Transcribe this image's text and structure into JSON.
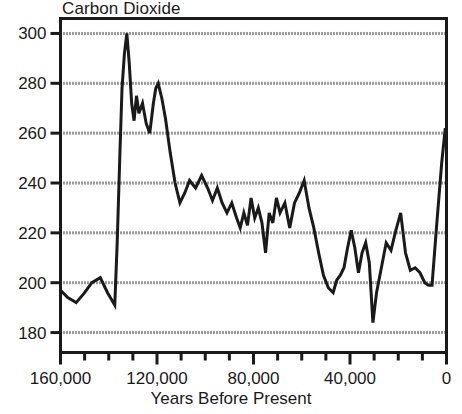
{
  "chart_data": {
    "type": "line",
    "title": "Carbon Dioxide",
    "xlabel": "Years Before Present",
    "ylabel": "",
    "xlim": [
      160000,
      0
    ],
    "ylim": [
      172,
      306
    ],
    "x_reversed": true,
    "grid": true,
    "grid_axis": "y",
    "legend": "none",
    "xtick_labels": [
      "160,000",
      "120,000",
      "80,000",
      "40,000",
      "0"
    ],
    "xtick_values": [
      160000,
      120000,
      80000,
      40000,
      0
    ],
    "x_minor_tick_interval": 10000,
    "ytick_labels": [
      "300",
      "280",
      "260",
      "240",
      "220",
      "200",
      "180"
    ],
    "ytick_values": [
      300,
      280,
      260,
      240,
      220,
      200,
      180
    ],
    "series_name": "CO2 concentration (ppm)",
    "line_color": "#1a1a1a",
    "grid_color": "#b4b4b4",
    "axis_color": "#1a1a1a",
    "x": [
      160000,
      157000,
      153500,
      150000,
      147000,
      143500,
      140500,
      137500,
      136500,
      135500,
      134500,
      133500,
      132500,
      131500,
      130500,
      129500,
      128500,
      127500,
      126000,
      124500,
      123000,
      121500,
      120500,
      119500,
      118000,
      116500,
      114500,
      112500,
      110500,
      108500,
      106500,
      104000,
      101500,
      99000,
      97000,
      95000,
      93000,
      91000,
      89000,
      87000,
      85500,
      84000,
      82500,
      81000,
      79500,
      78000,
      76500,
      75000,
      73500,
      72000,
      70500,
      69000,
      67000,
      65000,
      63000,
      61000,
      59000,
      57000,
      55000,
      53000,
      51000,
      49000,
      47000,
      45500,
      44000,
      42500,
      41000,
      39500,
      38000,
      36500,
      35000,
      33500,
      32000,
      30500,
      29000,
      27000,
      25000,
      23000,
      21000,
      19000,
      17000,
      15000,
      13000,
      11000,
      9000,
      7500,
      6000,
      4000,
      2000,
      500,
      0
    ],
    "y": [
      197,
      194,
      192,
      196,
      200,
      202,
      196,
      191,
      216,
      248,
      278,
      292,
      300,
      288,
      272,
      265,
      275,
      268,
      272,
      264,
      260,
      272,
      278,
      280,
      274,
      266,
      252,
      240,
      232,
      236,
      241,
      238,
      243,
      238,
      233,
      238,
      232,
      228,
      232,
      226,
      222,
      228,
      223,
      234,
      226,
      230,
      224,
      212,
      228,
      224,
      234,
      228,
      232,
      222,
      232,
      236,
      241,
      230,
      222,
      212,
      203,
      198,
      196,
      201,
      203,
      206,
      214,
      221,
      214,
      204,
      212,
      216,
      208,
      184,
      196,
      206,
      216,
      213,
      221,
      228,
      212,
      205,
      206,
      204,
      200,
      199,
      199,
      224,
      248,
      262,
      257,
      270,
      278
    ]
  }
}
